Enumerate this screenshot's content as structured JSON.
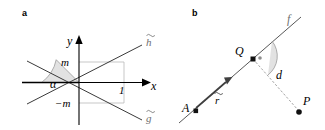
{
  "figure": {
    "panels": [
      {
        "id": "a",
        "label": "a",
        "kind": "coordinate-diagram",
        "axes": {
          "x_label": "x",
          "y_label": "y"
        },
        "annotations": [
          {
            "name": "m-label",
            "text": "m"
          },
          {
            "name": "negative-m-label",
            "text": "−m"
          },
          {
            "name": "unit-one-label",
            "text": "1"
          },
          {
            "name": "alpha-angle-label",
            "text": "α"
          },
          {
            "name": "line-h-label",
            "text": "h"
          },
          {
            "name": "line-g-label",
            "text": "g"
          }
        ],
        "lines": [
          {
            "name": "line-h",
            "label": "h",
            "slope": "+m",
            "accent": "tilde"
          },
          {
            "name": "line-g",
            "label": "g",
            "slope": "−m",
            "accent": "tilde"
          }
        ]
      },
      {
        "id": "b",
        "label": "b",
        "kind": "point-line-distance-diagram",
        "annotations": [
          {
            "name": "line-f-label",
            "text": "f"
          },
          {
            "name": "point-q-label",
            "text": "Q"
          },
          {
            "name": "point-a-label",
            "text": "A"
          },
          {
            "name": "point-p-label",
            "text": "P"
          },
          {
            "name": "distance-d-label",
            "text": "d"
          },
          {
            "name": "direction-vector-label",
            "text": "r",
            "accent": "bar"
          }
        ],
        "right_angle_marker": {
          "name": "right-angle-marker",
          "symbol": "·"
        }
      }
    ],
    "colors": {
      "stroke_dark": "#3a3a3a",
      "stroke_axis": "#000000",
      "stroke_gray_helper": "#b9b9b9",
      "arc_fill": "#d8d8d8",
      "label_gray": "#6f6f6f",
      "dash_gray": "#9a9a9a",
      "background": "#ffffff"
    }
  }
}
